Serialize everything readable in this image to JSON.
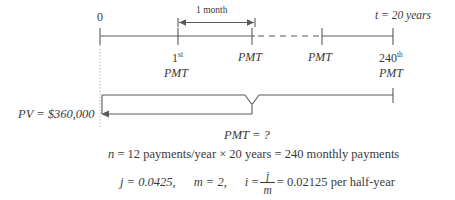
{
  "diagram": {
    "type": "annuity-timeline",
    "colors": {
      "line": "#5a5a5a",
      "text": "#3a3a3a",
      "background": "#ffffff",
      "dotted": "#9a9a9a"
    },
    "timeline": {
      "start_label": "0",
      "end_label_prefix": "t",
      "end_label": "t = 20 years",
      "span_label": "1 month",
      "ticks": [
        {
          "x": 100,
          "label": "0"
        },
        {
          "x": 178,
          "label": "1st PMT"
        },
        {
          "x": 252,
          "label": "PMT"
        },
        {
          "x": 322,
          "label": "PMT"
        },
        {
          "x": 393,
          "label": "240th PMT"
        }
      ]
    },
    "payment_labels": [
      {
        "ordinal": "1",
        "ordinal_suffix": "st",
        "text": "PMT"
      },
      {
        "ordinal": "",
        "ordinal_suffix": "",
        "text": "PMT"
      },
      {
        "ordinal": "",
        "ordinal_suffix": "",
        "text": "PMT"
      },
      {
        "ordinal": "240",
        "ordinal_suffix": "th",
        "text": "PMT"
      }
    ],
    "present_value": {
      "symbol": "PV",
      "equals": "=",
      "amount": "$360,000",
      "full": "PV = $360,000"
    },
    "brace_label": {
      "symbol": "PMT",
      "equals": "=",
      "value": "?",
      "full": "PMT = ?"
    },
    "equations": {
      "n_line": {
        "symbol": "n",
        "text": "= 12 payments/year × 20 years = 240 monthly payments"
      },
      "j_value": "j = 0.0425,",
      "m_value": "m = 2,",
      "i_symbol": "i",
      "i_equals": "=",
      "fraction_numerator": "j",
      "fraction_denominator": "m",
      "i_result": "= 0.02125 per half-year"
    }
  }
}
